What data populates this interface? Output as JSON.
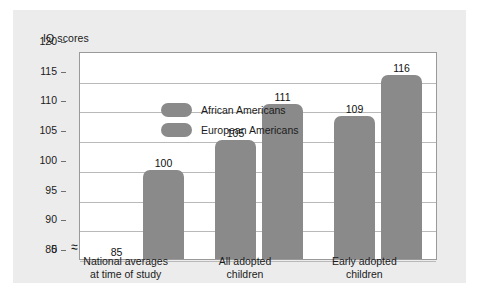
{
  "chart_data": {
    "type": "bar",
    "title": "",
    "ylabel": "IQ scores",
    "xlabel": "",
    "ylim": [
      85,
      120
    ],
    "yticks": [
      85,
      90,
      95,
      100,
      105,
      110,
      115,
      120
    ],
    "ytick_labels": [
      "85",
      "90",
      "95",
      "100",
      "105",
      "110",
      "115",
      "120"
    ],
    "axis_break": true,
    "axis_break_symbol": "≈",
    "zero_tick_label": "0",
    "grid": true,
    "legend_position": "top-left inside plot",
    "categories": [
      "National averages\nat time of study",
      "All adopted\nchildren",
      "Early adopted\nchildren"
    ],
    "category_lines": [
      [
        "National averages",
        "at time of study"
      ],
      [
        "All adopted",
        "children"
      ],
      [
        "Early adopted",
        "children"
      ]
    ],
    "series": [
      {
        "name": "African Americans",
        "color": "#8a8a8a",
        "values": [
          85,
          105,
          109
        ]
      },
      {
        "name": "European Americans",
        "color": "#8a8a8a",
        "values": [
          100,
          111,
          116
        ]
      }
    ],
    "value_labels": [
      "85",
      "100",
      "105",
      "111",
      "109",
      "116"
    ],
    "colors": {
      "bar": "#8a8a8a",
      "panel_background": "#ececec",
      "plot_background": "#ffffff",
      "gridline": "#b9b9b9",
      "frame": "#9a9a9a",
      "text": "#1b1b1b"
    }
  },
  "legend": {
    "items": [
      {
        "label": "African Americans"
      },
      {
        "label": "European Americans"
      }
    ]
  },
  "axis": {
    "y_title": "IQ scores"
  }
}
